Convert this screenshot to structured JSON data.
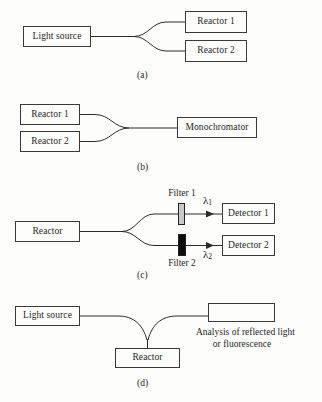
{
  "figure": {
    "background_color": "#fdfdfc",
    "line_color": "#2b2b2b",
    "box_border_color": "#3a3a3a"
  },
  "panels": [
    {
      "id": "a",
      "caption": "(a)",
      "boxes": [
        {
          "name": "light-source",
          "label": "Light source"
        },
        {
          "name": "reactor-1",
          "label": "Reactor 1"
        },
        {
          "name": "reactor-2",
          "label": "Reactor 2"
        }
      ]
    },
    {
      "id": "b",
      "caption": "(b)",
      "boxes": [
        {
          "name": "reactor-1",
          "label": "Reactor 1"
        },
        {
          "name": "reactor-2",
          "label": "Reactor 2"
        },
        {
          "name": "monochromator",
          "label": "Monochromator"
        }
      ]
    },
    {
      "id": "c",
      "caption": "(c)",
      "boxes": [
        {
          "name": "reactor",
          "label": "Reactor"
        },
        {
          "name": "detector-1",
          "label": "Detector 1"
        },
        {
          "name": "detector-2",
          "label": "Detector 2"
        }
      ],
      "filters": [
        {
          "name": "filter-1",
          "label": "Filter 1",
          "color": "#c9c9c9"
        },
        {
          "name": "filter-2",
          "label": "Filter 2",
          "color": "#0d0d0d"
        }
      ],
      "wavelengths": [
        {
          "name": "lambda-1",
          "symbol": "λ",
          "subscript": "1"
        },
        {
          "name": "lambda-2",
          "symbol": "λ",
          "subscript": "2"
        }
      ]
    },
    {
      "id": "d",
      "caption": "(d)",
      "boxes": [
        {
          "name": "light-source",
          "label": "Light source"
        },
        {
          "name": "reactor",
          "label": "Reactor"
        },
        {
          "name": "analysis-box",
          "label": ""
        }
      ],
      "analysis_caption_line1": "Analysis of reflected light",
      "analysis_caption_line2": "or fluorescence"
    }
  ]
}
